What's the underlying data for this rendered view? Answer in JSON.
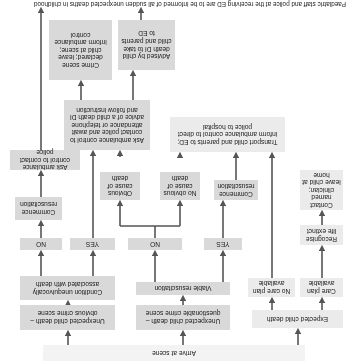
{
  "orientation_deg": 180,
  "colors": {
    "box": "#d9d9d9",
    "box_light": "#ebebeb",
    "box_pale": "#f3f3f3",
    "arrow": "#555555"
  },
  "nodes": {
    "arrive": "Arrive at scene",
    "expected": "Expected child death",
    "unexp_questionable": "Unexpected child death – questionable crime scene",
    "unexp_obvious": "Unexpected child death – obvious crime scene",
    "care_plan": "Care plan available",
    "no_care_plan": "No care plan available",
    "viable_resus": "Viable resuscitation",
    "condition_unequivocal": "Condition unequivocally associated with death",
    "yes_mid": "YES",
    "no_mid": "NO",
    "yes_right": "YES",
    "no_right": "NO",
    "recognise_life_extinct": "Recognise life extinct",
    "contact_clinician": "Contact named clinician; leave child at home",
    "commence_resus_mid": "Commence resuscitation",
    "no_obvious_cause": "No obvious cause of death",
    "obvious_cause": "Obvious cause of death",
    "commence_resus_right": "Commence resuscitation",
    "transport_to_ed": "Transport child and parents to ED; inform ambulance control to direct police to hospital",
    "ask_control_await_di": "Ask ambulance control to contact police and await attendance or telephone advice of a child death DI and follow instruction",
    "ask_control_police": "Ask ambulance control to contact police",
    "advised_by_di": "Advised by child death DI to take child and parents to ED",
    "crime_scene_declared": "Crime scene declared; leave child at scene; inform ambulance control"
  },
  "caption": "Paediatric staff and police at the receiving ED are to be informed of all sudden unexpected deaths in childhood"
}
